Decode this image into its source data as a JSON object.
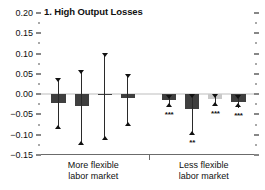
{
  "chart_data": {
    "type": "bar",
    "title": "1. High Output Losses",
    "xlabel": "",
    "ylabel": "",
    "ylim": [
      -0.15,
      0.2
    ],
    "yticks": [
      0.2,
      0.15,
      0.1,
      0.05,
      0.0,
      -0.05,
      -0.1,
      -0.15
    ],
    "ytick_labels": [
      "0.20",
      "0.15",
      "0.10",
      "0.05",
      "0.00",
      "−0.05",
      "−0.10",
      "−0.15"
    ],
    "minor_ticks": true,
    "grid": false,
    "legend": "none",
    "zero_line": true,
    "groups": [
      {
        "name": "More flexible labor market",
        "label_line1": "More flexible",
        "label_line2": "labor market"
      },
      {
        "name": "Less flexible labor market",
        "label_line1": "Less flexible",
        "label_line2": "labor market"
      }
    ],
    "categories": [
      "1",
      "2",
      "3",
      "4",
      "5",
      "6",
      "7",
      "8"
    ],
    "values": [
      -0.022,
      -0.03,
      -0.001,
      -0.01,
      -0.014,
      -0.037,
      -0.011,
      -0.019
    ],
    "ci_low": [
      -0.086,
      -0.125,
      -0.113,
      -0.078,
      -0.031,
      -0.1,
      -0.03,
      -0.033
    ],
    "ci_high": [
      0.041,
      0.06,
      0.102,
      0.05,
      -0.002,
      0.001,
      0.0,
      -0.002
    ],
    "significance": [
      "",
      "",
      "",
      "",
      "***",
      "**",
      "***",
      "***"
    ],
    "bar_colors": [
      "#3f3f3f",
      "#3f3f3f",
      "#3f3f3f",
      "#3f3f3f",
      "#3f3f3f",
      "#3f3f3f",
      "#c9c9c9",
      "#3f3f3f"
    ],
    "series": [
      {
        "name": "Output loss coefficient",
        "values": [
          -0.022,
          -0.03,
          -0.001,
          -0.01,
          -0.014,
          -0.037,
          -0.011,
          -0.019
        ]
      }
    ]
  },
  "colors": {
    "bar_dark": "#3f3f3f",
    "bar_light": "#c9c9c9",
    "axis": "#6b6b6b",
    "zero_line": "#bdbdbd",
    "text": "#111111"
  }
}
